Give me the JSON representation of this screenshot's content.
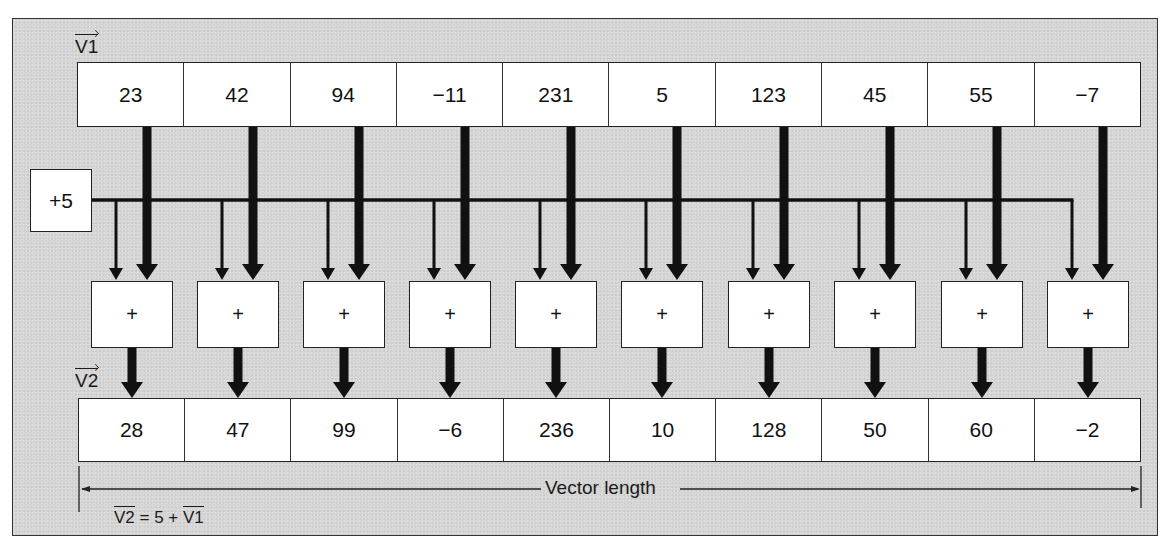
{
  "diagram": {
    "title_v1": "V1",
    "title_v2": "V2",
    "constant_label": "+5",
    "operator_symbol": "+",
    "v1": {
      "label": "V1",
      "values": [
        "23",
        "42",
        "94",
        "−11",
        "231",
        "5",
        "123",
        "45",
        "55",
        "−7"
      ]
    },
    "v2": {
      "label": "V2",
      "values": [
        "28",
        "47",
        "99",
        "−6",
        "236",
        "10",
        "128",
        "50",
        "60",
        "−2"
      ]
    },
    "adders": [
      "+",
      "+",
      "+",
      "+",
      "+",
      "+",
      "+",
      "+",
      "+",
      "+"
    ],
    "dimension_label": "Vector length",
    "formula": {
      "lhs": "V2",
      "middle": " = 5 + ",
      "rhs": "V1"
    },
    "colors": {
      "background": "#d6d6d6",
      "box_fill": "#ffffff",
      "ink": "#111111"
    }
  }
}
